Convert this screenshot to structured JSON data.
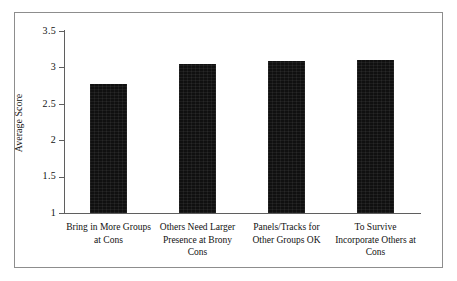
{
  "chart_data": {
    "type": "bar",
    "title": "",
    "subtitle": "",
    "xlabel": "",
    "ylabel": "Average Score",
    "categories": [
      "Bring in More Groups at Cons",
      "Others Need Larger Presence at Brony Cons",
      "Panels/Tracks for Other Groups OK",
      "To Survive Incorporate Others at Cons"
    ],
    "category_lines": [
      [
        "Bring in More Groups",
        "at Cons"
      ],
      [
        "Others Need Larger",
        "Presence at Brony",
        "Cons"
      ],
      [
        "Panels/Tracks for",
        "Other Groups OK"
      ],
      [
        "To Survive",
        "Incorporate Others at",
        "Cons"
      ]
    ],
    "values": [
      2.77,
      3.05,
      3.09,
      3.1
    ],
    "ylim": [
      1,
      3.5
    ],
    "yticks": [
      1,
      1.5,
      2,
      2.5,
      3,
      3.5
    ],
    "ytick_labels": [
      "1",
      "1.5",
      "2",
      "2.5",
      "3",
      "3.5"
    ],
    "grid": false,
    "legend": false,
    "legend_position": "none",
    "bar_color": "#101010",
    "axis_color": "#5f5f5f",
    "frame_color": "#8d8d8d",
    "background": "#ffffff"
  }
}
